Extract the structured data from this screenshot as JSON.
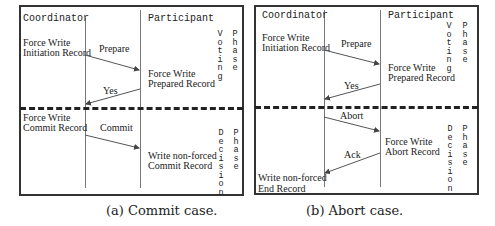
{
  "panels": [
    {
      "coordinator_label": "Coordinator",
      "participant_label": "Participant",
      "voting_phase_label": [
        "Voting",
        "Phase"
      ],
      "decision_phase_label": [
        "Decision",
        "Phase"
      ],
      "coord_notes": [
        "Force Write\nInitiation Record",
        "Force Write\nCommit Record"
      ],
      "part_notes": [
        "Force Write\nPrepared Record",
        "Write non-forced\nCommit Record"
      ],
      "messages": [
        "Prepare",
        "Yes",
        "Commit"
      ],
      "caption": "(a) Commit case."
    },
    {
      "coordinator_label": "Coordinator",
      "participant_label": "Participant",
      "voting_phase_label": [
        "Voting",
        "Phase"
      ],
      "decision_phase_label": [
        "Decision",
        "Phase"
      ],
      "coord_notes": [
        "Force Write\nInitiation Record",
        "Write non-forced\nEnd Record"
      ],
      "part_notes": [
        "Force Write\nPrepared Record",
        "Force Write\nAbort Record"
      ],
      "messages": [
        "Prepare",
        "Yes",
        "Abort",
        "Ack"
      ],
      "caption": "(b) Abort case."
    }
  ]
}
